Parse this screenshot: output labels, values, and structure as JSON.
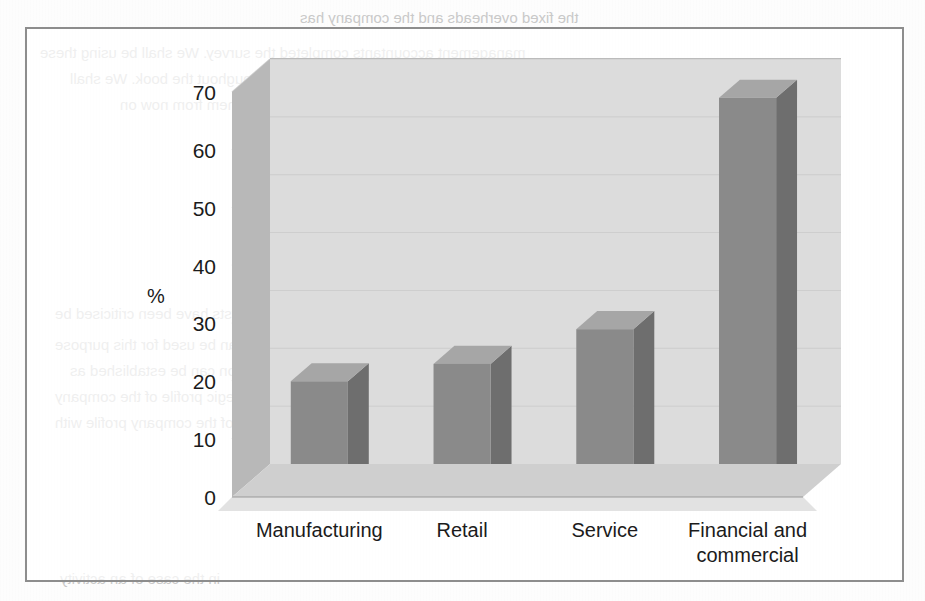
{
  "figure": {
    "frame_border_color": "#8d8d8d",
    "background_color": "#ffffff"
  },
  "bleed_through_text": {
    "line1": "management accountants completed the survey. We shall be using these",
    "line2": "a number of occasions throughout the book. We shall",
    "line3": "to them from now on",
    "heading": "ABSORPTION COSTING INFORMA",
    "line5": "of the ABC analysts have been criticised be",
    "line6": "based activity costs can be used for this purpose",
    "line7": "approach which the organisation can be established as",
    "line8": "to which a strategic profile of the company",
    "line9": "thereafter a strategic overview of the company profile with",
    "line10": "the fixed overheads and the company has",
    "line11": "in the case of an activity"
  },
  "chart_data": {
    "type": "bar",
    "title": "",
    "xlabel": "",
    "ylabel": "%",
    "categories": [
      "Manufacturing",
      "Retail",
      "Service",
      "Financial and commercial"
    ],
    "category_lines": [
      [
        "Manufacturing"
      ],
      [
        "Retail"
      ],
      [
        "Service"
      ],
      [
        "Financial and",
        "commercial"
      ]
    ],
    "values": [
      20,
      23,
      29,
      69
    ],
    "ylim": [
      0,
      70
    ],
    "ytick_values": [
      0,
      10,
      20,
      30,
      40,
      50,
      60,
      70
    ],
    "ytick_labels": [
      "0",
      "10",
      "20",
      "30",
      "40",
      "50",
      "60",
      "70"
    ],
    "grid": true,
    "grid_axis": "y",
    "legend": false,
    "three_d": true,
    "colors": {
      "bar_front": "#8a8a8a",
      "bar_side": "#6e6e6e",
      "bar_top": "#a6a6a6",
      "plot_back_wall": "#dcdcdc",
      "plot_left_wall": "#b8b8b8",
      "plot_floor": "#cfcfcf",
      "floor_front": "#e2e2e2",
      "gridline": "#a8a8a8",
      "text": "#1b1b1b"
    }
  }
}
